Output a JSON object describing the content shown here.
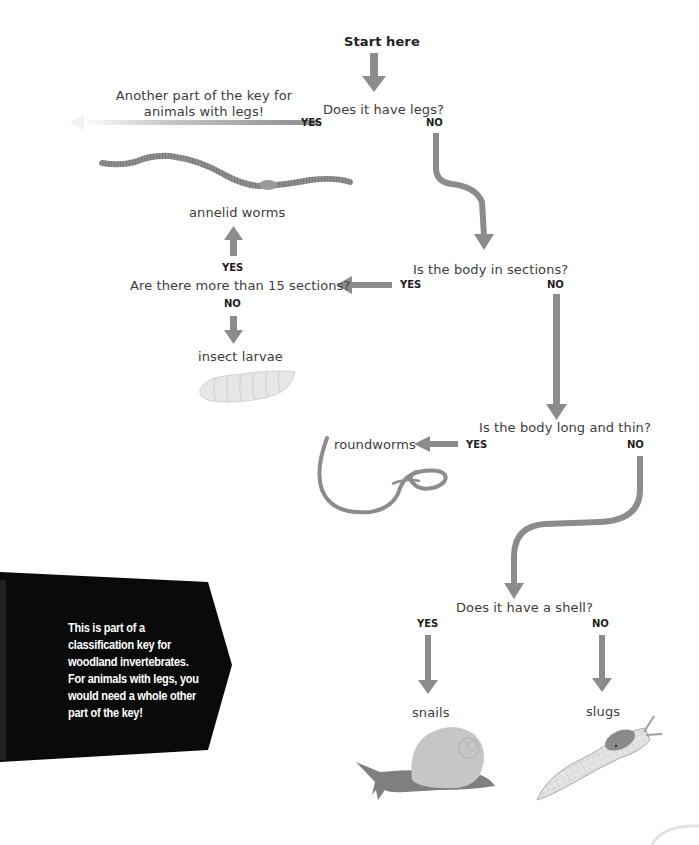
{
  "diagram": {
    "type": "dichotomous classification key",
    "start_label": "Start here",
    "questions": {
      "q1": "Does it have legs?",
      "q2": "Is the body in sections?",
      "q3": "Are there more than 15 sections?",
      "q4": "Is the body long and thin?",
      "q5": "Does it have a shell?"
    },
    "branch_labels": {
      "q1_yes": "YES",
      "q1_no": "NO",
      "q2_yes": "YES",
      "q2_no": "NO",
      "q3_yes": "YES",
      "q3_no": "NO",
      "q4_yes": "YES",
      "q4_no": "NO",
      "q5_yes": "YES",
      "q5_no": "NO"
    },
    "outcomes": {
      "legs": "Another part of the key for\nanimals with legs!",
      "legs_line1": "Another part of the key for",
      "legs_line2": "animals with legs!",
      "annelid": "annelid worms",
      "larvae": "insect larvae",
      "roundworms": "roundworms",
      "snails": "snails",
      "slugs": "slugs"
    },
    "note": "This is part of a\nclassification key for\nwoodland invertebrates.\nFor animals with legs, you\nwould need a whole other\npart of the key!",
    "colors": {
      "arrow": "#8c8c8c",
      "note_bg": "#0a0a0a",
      "note_text": "#ffffff",
      "worm": "#8a8a8a",
      "larva": "#e2e2e2",
      "snail_shell": "#c4c4c4",
      "snail_body": "#7f7f7f",
      "slug_body": "#dedede",
      "slug_mantle": "#8a8a8a"
    }
  }
}
